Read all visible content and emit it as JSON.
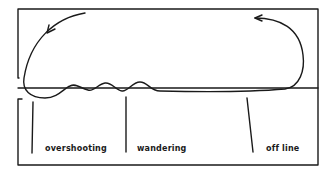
{
  "diagram": {
    "title": "",
    "colors": {
      "stroke": "#1a1a1a",
      "background": "#ffffff"
    },
    "labels": [
      {
        "id": "overshooting",
        "text": "overshooting",
        "x": 45,
        "y": 145
      },
      {
        "id": "wandering",
        "text": "wandering",
        "x": 137,
        "y": 145
      },
      {
        "id": "off-line",
        "text": "off line",
        "x": 266,
        "y": 145
      }
    ],
    "reference_line": {
      "y": 88,
      "x1": 18,
      "x2": 318
    },
    "markers": [
      {
        "label": "overshooting",
        "x1": 33,
        "y1": 102,
        "x2": 32,
        "y2": 153
      },
      {
        "label": "wandering",
        "x1": 126,
        "y1": 97,
        "x2": 126,
        "y2": 152
      },
      {
        "label": "off line",
        "x1": 247,
        "y1": 98,
        "x2": 253,
        "y2": 152
      }
    ]
  }
}
